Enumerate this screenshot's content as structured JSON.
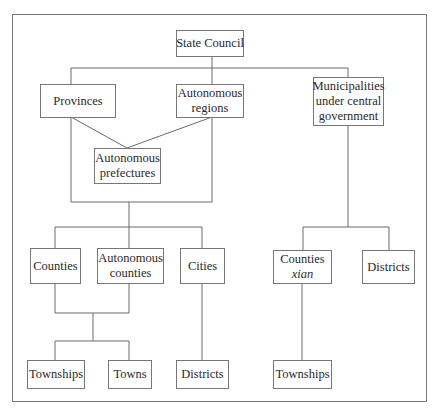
{
  "diagram": {
    "type": "hierarchy",
    "nodes": {
      "state_council": {
        "lines": [
          "State Council"
        ]
      },
      "provinces": {
        "lines": [
          "Provinces"
        ]
      },
      "autonomous_regions": {
        "lines": [
          "Autonomous",
          "regions"
        ]
      },
      "municipalities": {
        "lines": [
          "Municipalities",
          "under central",
          "government"
        ]
      },
      "autonomous_prefectures": {
        "lines": [
          "Autonomous",
          "prefectures"
        ]
      },
      "counties": {
        "lines": [
          "Counties"
        ]
      },
      "autonomous_counties": {
        "lines": [
          "Autonomous",
          "counties"
        ]
      },
      "cities": {
        "lines": [
          "Cities"
        ]
      },
      "counties_xian": {
        "lines": [
          "Counties",
          "xian"
        ]
      },
      "muni_districts": {
        "lines": [
          "Districts"
        ]
      },
      "townships": {
        "lines": [
          "Townships"
        ]
      },
      "towns": {
        "lines": [
          "Towns"
        ]
      },
      "city_districts": {
        "lines": [
          "Districts"
        ]
      },
      "xian_townships": {
        "lines": [
          "Townships"
        ]
      }
    },
    "edges": [
      [
        "State Council",
        "Provinces"
      ],
      [
        "State Council",
        "Autonomous regions"
      ],
      [
        "State Council",
        "Municipalities under central government"
      ],
      [
        "Provinces",
        "Autonomous prefectures"
      ],
      [
        "Autonomous regions",
        "Autonomous prefectures"
      ],
      [
        "Provinces / Autonomous regions / Autonomous prefectures",
        "Counties"
      ],
      [
        "Provinces / Autonomous regions / Autonomous prefectures",
        "Autonomous counties"
      ],
      [
        "Provinces / Autonomous regions / Autonomous prefectures",
        "Cities"
      ],
      [
        "Counties / Autonomous counties",
        "Townships"
      ],
      [
        "Counties / Autonomous counties",
        "Towns"
      ],
      [
        "Cities",
        "Districts"
      ],
      [
        "Municipalities under central government",
        "Counties xian"
      ],
      [
        "Municipalities under central government",
        "Districts"
      ],
      [
        "Counties xian",
        "Townships"
      ]
    ]
  }
}
